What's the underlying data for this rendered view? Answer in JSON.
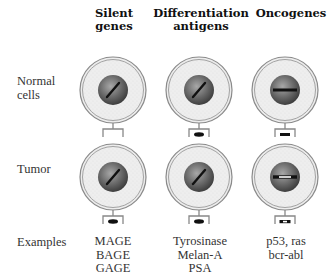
{
  "columns": [
    {
      "id": "silent",
      "header_line1": "Silent",
      "header_line2": "genes",
      "examples": [
        "MAGE",
        "BAGE",
        "GAGE"
      ]
    },
    {
      "id": "differentiation",
      "header_line1": "Differentiation",
      "header_line2": "antigens",
      "examples": [
        "Tyrosinase",
        "Melan-A",
        "PSA"
      ]
    },
    {
      "id": "oncogenes",
      "header_line1": "Oncogenes",
      "header_line2": "",
      "examples": [
        "p53, ras",
        "bcr-abl"
      ]
    }
  ],
  "rows": [
    {
      "id": "normal",
      "label_line1": "Normal",
      "label_line2": "cells"
    },
    {
      "id": "tumor",
      "label_line1": "Tumor",
      "label_line2": ""
    }
  ],
  "examples_label": "Examples",
  "cells": [
    {
      "row": "normal",
      "col": "silent",
      "gene": "diagonal",
      "surface_antigen": "none"
    },
    {
      "row": "normal",
      "col": "differentiation",
      "gene": "diagonal",
      "surface_antigen": "peptide"
    },
    {
      "row": "normal",
      "col": "oncogenes",
      "gene": "horizontal",
      "surface_antigen": "peptide"
    },
    {
      "row": "tumor",
      "col": "silent",
      "gene": "diagonal",
      "surface_antigen": "peptide"
    },
    {
      "row": "tumor",
      "col": "differentiation",
      "gene": "diagonal",
      "surface_antigen": "peptide"
    },
    {
      "row": "tumor",
      "col": "oncogenes",
      "gene": "horizontal-mutated",
      "surface_antigen": "mutated-peptide"
    }
  ],
  "colors": {
    "membrane": "#8a8a8a",
    "cytoplasm": "#ececec",
    "nucleus_dark": "#3a3a3a",
    "nucleus_light": "#9a9a9a",
    "gene": "#111111",
    "receptor": "#888888"
  }
}
